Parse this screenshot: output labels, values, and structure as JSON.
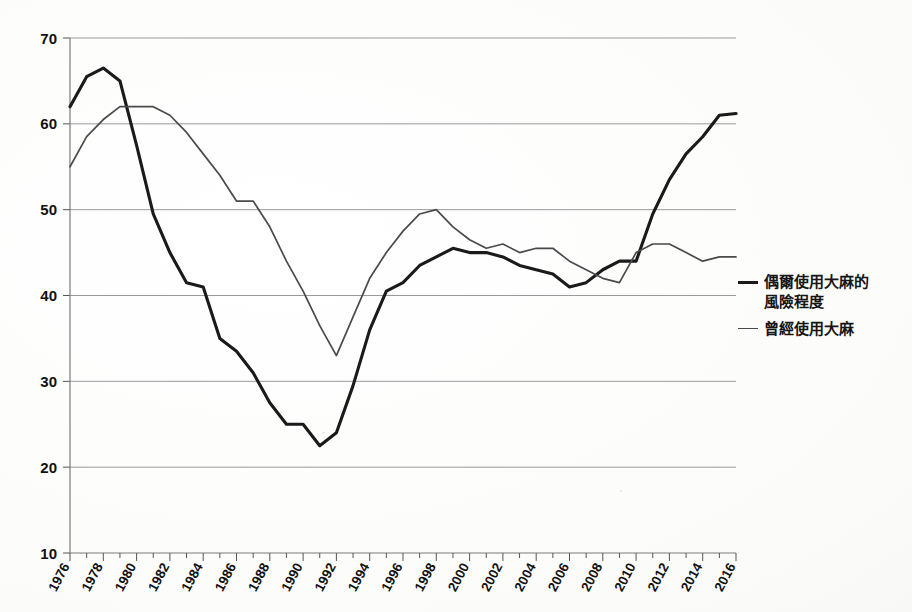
{
  "chart_data": {
    "type": "line",
    "title": "",
    "subtitle": "",
    "xlabel": "",
    "ylabel": "",
    "xlim": [
      1976,
      2016
    ],
    "ylim": [
      10,
      70
    ],
    "ytick_step": 10,
    "grid": true,
    "legend_position": "right",
    "yticks": [
      "10",
      "20",
      "30",
      "40",
      "50",
      "60",
      "70"
    ],
    "xticks": [
      "1976",
      "1978",
      "1980",
      "1982",
      "1984",
      "1986",
      "1988",
      "1990",
      "1992",
      "1994",
      "1996",
      "1998",
      "2000",
      "2002",
      "2004",
      "2006",
      "2008",
      "2010",
      "2012",
      "2014",
      "2016"
    ],
    "x": [
      1976,
      1977,
      1978,
      1979,
      1980,
      1981,
      1982,
      1983,
      1984,
      1985,
      1986,
      1987,
      1988,
      1989,
      1990,
      1991,
      1992,
      1993,
      1994,
      1995,
      1996,
      1997,
      1998,
      1999,
      2000,
      2001,
      2002,
      2003,
      2004,
      2005,
      2006,
      2007,
      2008,
      2009,
      2010,
      2011,
      2012,
      2013,
      2014,
      2015,
      2016
    ],
    "series": [
      {
        "name": "偶爾使用大麻的風險程度",
        "style": "bold",
        "color": "#1a1a1a",
        "values": [
          62.0,
          65.5,
          66.5,
          65.0,
          57.5,
          49.5,
          45.0,
          41.5,
          41.0,
          35.0,
          33.5,
          31.0,
          27.5,
          25.0,
          25.0,
          22.5,
          24.0,
          29.5,
          36.0,
          40.5,
          41.5,
          43.5,
          44.5,
          45.5,
          45.0,
          45.0,
          44.5,
          43.5,
          43.0,
          42.5,
          41.0,
          41.5,
          43.0,
          44.0,
          44.0,
          49.5,
          53.5,
          56.5,
          58.5,
          61.0,
          61.2
        ]
      },
      {
        "name": "曾經使用大麻",
        "style": "thin",
        "color": "#4a4a4a",
        "values": [
          55.0,
          58.5,
          60.5,
          62.0,
          62.0,
          62.0,
          61.0,
          59.0,
          56.5,
          54.0,
          51.0,
          51.0,
          48.0,
          44.0,
          40.5,
          36.5,
          33.0,
          37.5,
          42.0,
          45.0,
          47.5,
          49.5,
          50.0,
          48.0,
          46.5,
          45.5,
          46.0,
          45.0,
          45.5,
          45.5,
          44.0,
          43.0,
          42.0,
          41.5,
          45.0,
          46.0,
          46.0,
          45.0,
          44.0,
          44.5,
          44.5
        ]
      }
    ]
  },
  "legend": {
    "entries": [
      {
        "label": "偶爾使用大麻的\n風險程度",
        "style": "bold"
      },
      {
        "label": "曾經使用大麻",
        "style": "thin"
      }
    ]
  },
  "colors": {
    "background": "#fdfdfd",
    "grid": "#9a9a9a",
    "axis": "#7a7a7a",
    "bold_series": "#1a1a1a",
    "thin_series": "#4a4a4a",
    "text": "#111111"
  }
}
